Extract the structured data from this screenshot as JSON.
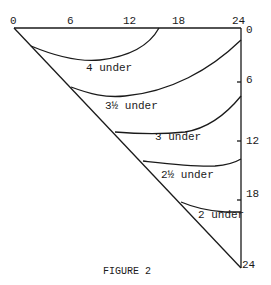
{
  "figure": {
    "caption": "FIGURE 2",
    "top_axis": {
      "ticks": [
        "0",
        "6",
        "12",
        "18",
        "24"
      ]
    },
    "right_axis": {
      "ticks": [
        "0",
        "6",
        "12",
        "18",
        "24"
      ]
    },
    "curves": [
      {
        "label": "4 under"
      },
      {
        "label": "3½ under"
      },
      {
        "label": "3 under"
      },
      {
        "label": "2½ under"
      },
      {
        "label": "2 under"
      }
    ]
  }
}
